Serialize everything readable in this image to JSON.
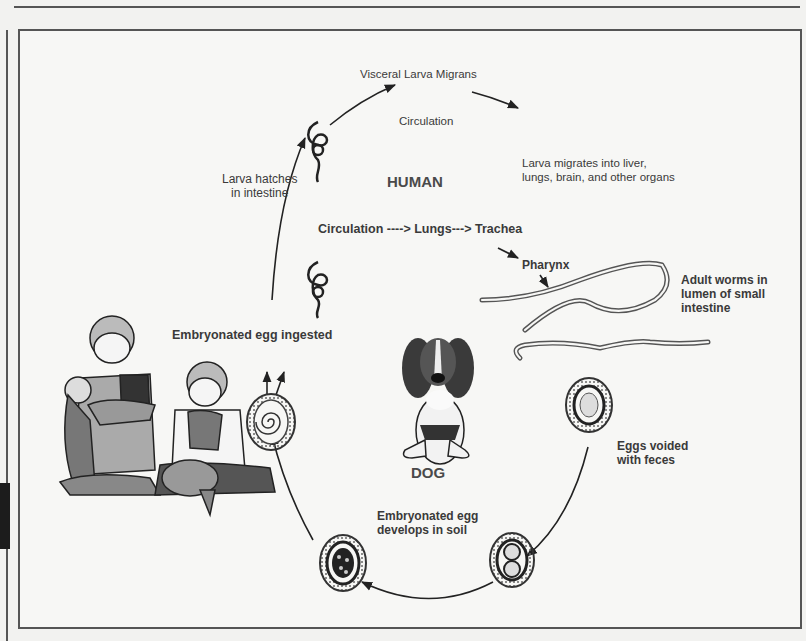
{
  "diagram": {
    "title": "Visceral Larva Migrans",
    "hosts": {
      "human": "HUMAN",
      "dog": "DOG"
    },
    "stages": [
      {
        "id": "circulation",
        "label": "Circulation"
      },
      {
        "id": "larva-migrates",
        "label_lines": [
          "Larva migrates into liver,",
          "lungs, brain, and other organs"
        ]
      },
      {
        "id": "larva-hatches",
        "label_lines": [
          "Larva hatches",
          "in intestine"
        ]
      },
      {
        "id": "lung-pathway",
        "label": "Circulation ----> Lungs---> Trachea"
      },
      {
        "id": "pharynx",
        "label": "Pharynx"
      },
      {
        "id": "adult-worms",
        "label_lines": [
          "Adult worms in",
          "lumen of small",
          "intestine"
        ]
      },
      {
        "id": "egg-ingested",
        "label": "Embryonated egg ingested"
      },
      {
        "id": "eggs-voided",
        "label_lines": [
          "Eggs voided",
          "with feces"
        ]
      },
      {
        "id": "egg-develops",
        "label_lines": [
          "Embryonated egg",
          "develops in soil"
        ]
      }
    ],
    "illustrations": [
      "children-with-puppy",
      "basset-hound-dog",
      "larva",
      "adult-roundworms",
      "egg-unembryonated",
      "egg-two-cell",
      "egg-morula",
      "egg-embryonated"
    ],
    "colors": {
      "background": "#f7f7f5",
      "line": "#333333",
      "text": "#3a3a3a",
      "frame": "#555555"
    }
  }
}
